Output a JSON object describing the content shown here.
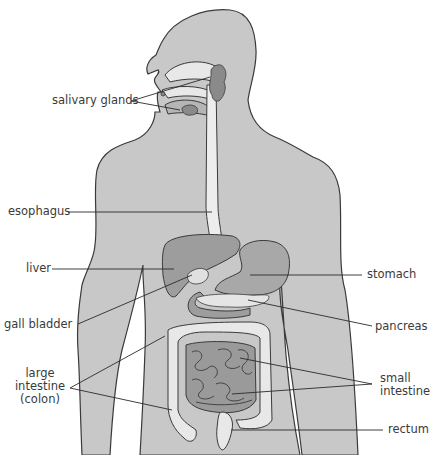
{
  "diagram": {
    "colors": {
      "background": "#ffffff",
      "body_fill": "#c8c8c8",
      "outline": "#3a3a3a",
      "organ_dark": "#9d9d9d",
      "organ_mid": "#a8a8a8",
      "organ_light": "#e8e8e8",
      "leader_line": "#2a2a2a",
      "label_text": "#3a3a3a"
    },
    "labels": {
      "salivary_glands": "salivary glands",
      "esophagus": "esophagus",
      "liver": "liver",
      "gall_bladder": "gall bladder",
      "large_intestine_line1": "large",
      "large_intestine_line2": "intestine",
      "large_intestine_line3": "(colon)",
      "stomach": "stomach",
      "pancreas": "pancreas",
      "small_intestine_line1": "small",
      "small_intestine_line2": "intestine",
      "rectum": "rectum"
    }
  }
}
